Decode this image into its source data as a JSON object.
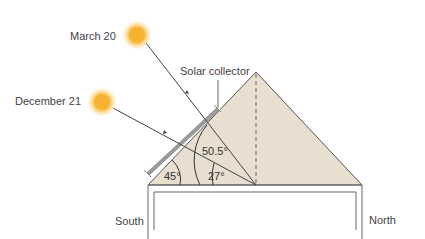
{
  "diagram": {
    "type": "solar-collector-angle-diagram",
    "labels": {
      "march": "March 20",
      "december": "December 21",
      "collector": "Solar collector",
      "south": "South",
      "north": "North"
    },
    "angles": {
      "roof": "45°",
      "march_sun": "50.5°",
      "december_sun": "27°"
    },
    "colors": {
      "roof_fill": "#e8dfd0",
      "line": "#555555",
      "collector": "#9a9a9a",
      "sun_core": "#f7b733",
      "sun_glow": "#fbd27a"
    }
  }
}
